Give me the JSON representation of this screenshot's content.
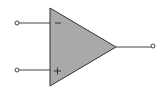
{
  "diagram": {
    "component": "operational-amplifier",
    "inputs": [
      {
        "name": "inverting",
        "sign": "−"
      },
      {
        "name": "non-inverting",
        "sign": "+"
      }
    ],
    "output": {
      "name": "output"
    },
    "colors": {
      "fill": "#a9a9a9",
      "stroke": "#333333"
    }
  }
}
